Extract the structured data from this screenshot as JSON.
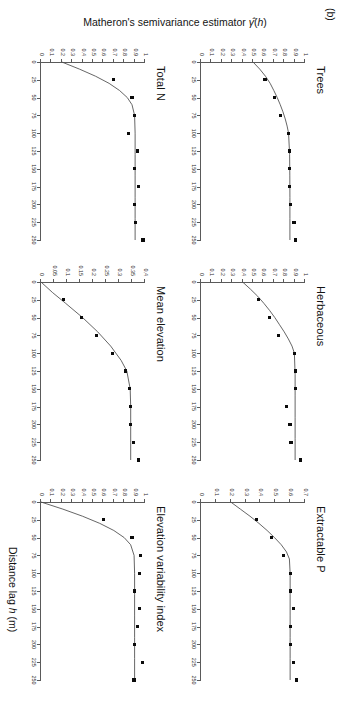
{
  "figure": {
    "panel_letter": "(b)",
    "shared_xlabel": "Distance lag h (m)",
    "shared_ylabel": "Matheron's semivariance estimator",
    "shared_ylabel_symbol": "γ(h)",
    "xticks": [
      "0",
      "25",
      "50",
      "75",
      "100",
      "125",
      "150",
      "175",
      "200",
      "225",
      "250"
    ],
    "background": "#ffffff",
    "point_color": "#0b0b0b",
    "line_color": "#4a4a4a",
    "axis_color": "#5a5a5a"
  },
  "chart_data": [
    {
      "type": "scatter",
      "title": "Trees",
      "xlabel": "Distance lag h (m)",
      "ylabel": "Matheron's semivariance estimator",
      "xlim": [
        0,
        250
      ],
      "ylim": [
        0,
        1
      ],
      "xticks": [
        0,
        25,
        50,
        75,
        100,
        125,
        150,
        175,
        200,
        225,
        250
      ],
      "yticks": [
        0,
        0.1,
        0.2,
        0.3,
        0.4,
        0.5,
        0.6,
        0.7,
        0.8,
        0.9,
        1
      ],
      "ytick_labels": [
        "0",
        "0.1",
        "0.2",
        "0.3",
        "0.4",
        "0.5",
        "0.6",
        "0.7",
        "0.8",
        "0.9",
        "1"
      ],
      "grid": false,
      "legend": "none",
      "x": [
        25,
        50,
        75,
        100,
        125,
        150,
        175,
        200,
        225,
        250
      ],
      "values": [
        0.615,
        0.705,
        0.765,
        0.845,
        0.85,
        0.85,
        0.85,
        0.86,
        0.895,
        0.91
      ],
      "model_curve": {
        "nugget": 0.5,
        "sill": 0.855,
        "range": 95,
        "x": [
          0,
          10,
          20,
          30,
          40,
          50,
          60,
          70,
          80,
          90,
          100,
          130,
          160,
          190,
          220,
          250
        ],
        "y": [
          0.5,
          0.565,
          0.62,
          0.665,
          0.7,
          0.733,
          0.762,
          0.788,
          0.81,
          0.828,
          0.842,
          0.852,
          0.854,
          0.855,
          0.855,
          0.855
        ]
      }
    },
    {
      "type": "scatter",
      "title": "Herbaceous",
      "xlabel": "Distance lag h (m)",
      "ylabel": "Matheron's semivariance estimator",
      "xlim": [
        0,
        250
      ],
      "ylim": [
        0,
        1
      ],
      "xticks": [
        0,
        25,
        50,
        75,
        100,
        125,
        150,
        175,
        200,
        225,
        250
      ],
      "yticks": [
        0,
        0.1,
        0.2,
        0.3,
        0.4,
        0.5,
        0.6,
        0.7,
        0.8,
        0.9,
        1
      ],
      "ytick_labels": [
        "0",
        "0.1",
        "0.2",
        "0.3",
        "0.4",
        "0.5",
        "0.6",
        "0.7",
        "0.8",
        "0.9",
        "1"
      ],
      "grid": false,
      "legend": "none",
      "x": [
        25,
        50,
        75,
        100,
        125,
        150,
        175,
        200,
        225,
        250
      ],
      "values": [
        0.555,
        0.655,
        0.745,
        0.9,
        0.905,
        0.905,
        0.825,
        0.855,
        0.865,
        0.955
      ],
      "model_curve": {
        "nugget": 0.4,
        "sill": 0.905,
        "range": 100,
        "x": [
          0,
          10,
          20,
          30,
          40,
          50,
          60,
          70,
          80,
          90,
          100,
          130,
          160,
          190,
          220,
          250
        ],
        "y": [
          0.4,
          0.475,
          0.545,
          0.605,
          0.66,
          0.71,
          0.755,
          0.8,
          0.84,
          0.875,
          0.898,
          0.905,
          0.905,
          0.905,
          0.905,
          0.905
        ]
      }
    },
    {
      "type": "scatter",
      "title": "Extractable P",
      "xlabel": "Distance lag h (m)",
      "ylabel": "Matheron's semivariance estimator",
      "xlim": [
        0,
        250
      ],
      "ylim": [
        0,
        0.7
      ],
      "xticks": [
        0,
        25,
        50,
        75,
        100,
        125,
        150,
        175,
        200,
        225,
        250
      ],
      "yticks": [
        0,
        0.1,
        0.2,
        0.3,
        0.4,
        0.5,
        0.6,
        0.7
      ],
      "ytick_labels": [
        "0",
        "0.1",
        "0.2",
        "0.3",
        "0.4",
        "0.5",
        "0.6",
        "0.7"
      ],
      "grid": false,
      "legend": "none",
      "x": [
        25,
        50,
        75,
        100,
        125,
        150,
        175,
        200,
        225,
        250
      ],
      "values": [
        0.375,
        0.475,
        0.555,
        0.6,
        0.6,
        0.625,
        0.6,
        0.6,
        0.625,
        0.645
      ],
      "model_curve": {
        "nugget": 0.2,
        "sill": 0.6,
        "range": 72,
        "x": [
          0,
          10,
          20,
          30,
          40,
          50,
          60,
          70,
          80,
          100,
          130,
          160,
          190,
          220,
          250
        ],
        "y": [
          0.2,
          0.265,
          0.33,
          0.39,
          0.445,
          0.495,
          0.54,
          0.575,
          0.595,
          0.6,
          0.6,
          0.6,
          0.6,
          0.6,
          0.6
        ]
      }
    },
    {
      "type": "scatter",
      "title": "Total N",
      "xlabel": "Distance lag h (m)",
      "ylabel": "Matheron's semivariance estimator",
      "xlim": [
        0,
        250
      ],
      "ylim": [
        0,
        1
      ],
      "xticks": [
        0,
        25,
        50,
        75,
        100,
        125,
        150,
        175,
        200,
        225,
        250
      ],
      "yticks": [
        0,
        0.1,
        0.2,
        0.3,
        0.4,
        0.5,
        0.6,
        0.7,
        0.8,
        0.9,
        1
      ],
      "ytick_labels": [
        "0",
        "0.1",
        "0.2",
        "0.3",
        "0.4",
        "0.5",
        "0.6",
        "0.7",
        "0.8",
        "0.9",
        "1"
      ],
      "grid": false,
      "legend": "none",
      "x": [
        25,
        50,
        75,
        100,
        125,
        150,
        175,
        200,
        225,
        250
      ],
      "values": [
        0.7,
        0.875,
        0.9,
        0.845,
        0.925,
        0.9,
        0.935,
        0.9,
        0.905,
        0.98
      ],
      "model_curve": {
        "nugget": 0.2,
        "sill": 0.905,
        "range": 55,
        "x": [
          0,
          10,
          20,
          30,
          40,
          50,
          60,
          75,
          100,
          130,
          160,
          190,
          220,
          250
        ],
        "y": [
          0.2,
          0.37,
          0.525,
          0.655,
          0.755,
          0.83,
          0.875,
          0.9,
          0.905,
          0.905,
          0.905,
          0.905,
          0.905,
          0.905
        ]
      }
    },
    {
      "type": "scatter",
      "title": "Mean elevation",
      "xlabel": "Distance lag h (m)",
      "ylabel": "Matheron's semivariance estimator",
      "xlim": [
        0,
        250
      ],
      "ylim": [
        0,
        0.4
      ],
      "xticks": [
        0,
        25,
        50,
        75,
        100,
        125,
        150,
        175,
        200,
        225,
        250
      ],
      "yticks": [
        0,
        0.05,
        0.1,
        0.15,
        0.2,
        0.25,
        0.3,
        0.35,
        0.4
      ],
      "ytick_labels": [
        "0",
        "0.05",
        "0.1",
        "0.15",
        "0.2",
        "0.25",
        "0.3",
        "0.35",
        "0.4"
      ],
      "grid": false,
      "legend": "none",
      "x": [
        25,
        50,
        75,
        100,
        125,
        150,
        175,
        200,
        225,
        250
      ],
      "values": [
        0.085,
        0.155,
        0.215,
        0.275,
        0.325,
        0.34,
        0.345,
        0.345,
        0.355,
        0.375
      ],
      "model_curve": {
        "nugget": 0.0,
        "sill": 0.345,
        "range": 125,
        "x": [
          0,
          15,
          30,
          50,
          70,
          90,
          110,
          125,
          150,
          175,
          200,
          225,
          250
        ],
        "y": [
          0.0,
          0.045,
          0.095,
          0.16,
          0.218,
          0.268,
          0.308,
          0.33,
          0.343,
          0.345,
          0.345,
          0.345,
          0.345
        ]
      }
    },
    {
      "type": "scatter",
      "title": "Elevation variability index",
      "xlabel": "Distance lag h (m)",
      "ylabel": "Matheron's semivariance estimator",
      "xlim": [
        0,
        250
      ],
      "ylim": [
        0,
        1
      ],
      "xticks": [
        0,
        25,
        50,
        75,
        100,
        125,
        150,
        175,
        200,
        225,
        250
      ],
      "yticks": [
        0,
        0.1,
        0.2,
        0.3,
        0.4,
        0.5,
        0.6,
        0.7,
        0.8,
        0.9,
        1
      ],
      "ytick_labels": [
        "0",
        "0.1",
        "0.2",
        "0.3",
        "0.4",
        "0.5",
        "0.6",
        "0.7",
        "0.8",
        "0.9",
        "1"
      ],
      "grid": false,
      "legend": "none",
      "x": [
        25,
        50,
        75,
        100,
        125,
        150,
        175,
        200,
        225,
        250
      ],
      "values": [
        0.6,
        0.875,
        0.955,
        0.945,
        0.9,
        0.945,
        0.93,
        0.9,
        0.975,
        0.895
      ],
      "model_curve": {
        "nugget": 0.0,
        "sill": 0.9,
        "range": 52,
        "x": [
          0,
          10,
          20,
          30,
          40,
          50,
          60,
          75,
          100,
          130,
          160,
          190,
          220,
          250
        ],
        "y": [
          0.0,
          0.21,
          0.4,
          0.565,
          0.7,
          0.8,
          0.862,
          0.895,
          0.9,
          0.9,
          0.9,
          0.9,
          0.9,
          0.9
        ]
      }
    }
  ]
}
